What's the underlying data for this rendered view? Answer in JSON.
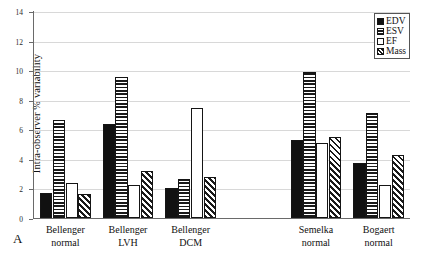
{
  "panel": {
    "letter": "A"
  },
  "chart_data": {
    "type": "bar",
    "title": "",
    "xlabel": "",
    "ylabel": "Intra-observer % variability",
    "ylim": [
      0,
      14
    ],
    "ytick_step": 2,
    "yticks": [
      0,
      2,
      4,
      6,
      8,
      10,
      12,
      14
    ],
    "ytick_labels": [
      "0",
      "2",
      "4",
      "6",
      "8",
      "10",
      "12",
      "14"
    ],
    "grid": true,
    "legend_position": "top-right",
    "categories": [
      "Bellenger normal",
      "Bellenger LVH",
      "Bellenger DCM",
      "Semelka normal",
      "Bogaert normal"
    ],
    "category_lines": [
      [
        "Bellenger",
        "normal"
      ],
      [
        "Bellenger",
        "LVH"
      ],
      [
        "Bellenger",
        "DCM"
      ],
      [
        "Semelka",
        "normal"
      ],
      [
        "Bogaert",
        "normal"
      ]
    ],
    "series": [
      {
        "name": "EDV",
        "fill": "solid-black",
        "values": [
          1.7,
          6.35,
          2.05,
          5.3,
          3.75
        ]
      },
      {
        "name": "ESV",
        "fill": "horizontal-lines",
        "values": [
          6.6,
          9.55,
          2.65,
          9.85,
          7.1
        ]
      },
      {
        "name": "EF",
        "fill": "white",
        "values": [
          2.4,
          2.25,
          7.45,
          5.1,
          2.2
        ]
      },
      {
        "name": "Mass",
        "fill": "diagonal-lines",
        "values": [
          1.65,
          3.2,
          2.8,
          5.45,
          4.25
        ]
      }
    ]
  },
  "legend": {
    "items": [
      {
        "label": "EDV",
        "fill": "solid-black"
      },
      {
        "label": "ESV",
        "fill": "horizontal-lines"
      },
      {
        "label": "EF",
        "fill": "white"
      },
      {
        "label": "Mass",
        "fill": "diagonal-lines"
      }
    ]
  }
}
